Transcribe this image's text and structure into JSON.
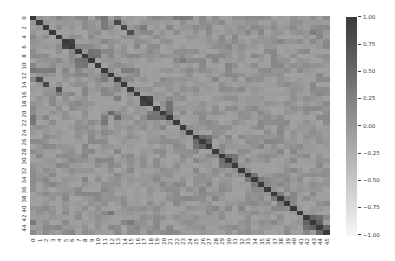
{
  "chart_data": {
    "type": "heatmap",
    "title": "",
    "xlabel": "",
    "ylabel": "",
    "n": 46,
    "x_tick_labels": [
      "0",
      "1",
      "2",
      "3",
      "4",
      "5",
      "6",
      "7",
      "8",
      "9",
      "10",
      "11",
      "12",
      "13",
      "14",
      "15",
      "16",
      "17",
      "18",
      "19",
      "20",
      "21",
      "22",
      "23",
      "24",
      "25",
      "26",
      "27",
      "28",
      "29",
      "30",
      "31",
      "32",
      "33",
      "34",
      "35",
      "36",
      "37",
      "38",
      "39",
      "40",
      "41",
      "42",
      "43",
      "44",
      "45"
    ],
    "y_tick_labels": [
      "0",
      "2",
      "4",
      "6",
      "8",
      "10",
      "12",
      "14",
      "16",
      "18",
      "20",
      "22",
      "24",
      "26",
      "28",
      "30",
      "32",
      "34",
      "36",
      "38",
      "40",
      "42",
      "44"
    ],
    "colorbar": {
      "vmin": -1.0,
      "vmax": 1.0,
      "ticks": [
        "1.00",
        "0.75",
        "0.50",
        "0.25",
        "0.00",
        "-0.25",
        "-0.50",
        "-0.75",
        "-1.00"
      ],
      "tick_values": [
        1.0,
        0.75,
        0.5,
        0.25,
        0.0,
        -0.25,
        -0.5,
        -0.75,
        -1.0
      ],
      "cmap": "grayscale (white at -1 → dark gray at +1)"
    },
    "diagonal_value": 1.0,
    "background_range": [
      -0.1,
      0.2
    ],
    "notable_cells": [
      {
        "r": 0,
        "c": 11,
        "v": 0.35
      },
      {
        "r": 1,
        "c": 11,
        "v": 0.3
      },
      {
        "r": 2,
        "c": 11,
        "v": 0.3
      },
      {
        "r": 1,
        "c": 13,
        "v": 0.85
      },
      {
        "r": 2,
        "c": 14,
        "v": 0.85
      },
      {
        "r": 3,
        "c": 15,
        "v": 0.8
      },
      {
        "r": 5,
        "c": 6,
        "v": 0.9
      },
      {
        "r": 6,
        "c": 5,
        "v": 0.9
      },
      {
        "r": 7,
        "c": 9,
        "v": 0.4
      },
      {
        "r": 7,
        "c": 10,
        "v": 0.35
      },
      {
        "r": 8,
        "c": 9,
        "v": 0.4
      },
      {
        "r": 8,
        "c": 10,
        "v": 0.4
      },
      {
        "r": 9,
        "c": 7,
        "v": 0.4
      },
      {
        "r": 9,
        "c": 8,
        "v": 0.4
      },
      {
        "r": 10,
        "c": 7,
        "v": 0.35
      },
      {
        "r": 10,
        "c": 8,
        "v": 0.4
      },
      {
        "r": 11,
        "c": 0,
        "v": 0.35
      },
      {
        "r": 11,
        "c": 1,
        "v": 0.3
      },
      {
        "r": 11,
        "c": 2,
        "v": 0.3
      },
      {
        "r": 11,
        "c": 3,
        "v": 0.3
      },
      {
        "r": 11,
        "c": 14,
        "v": 0.3
      },
      {
        "r": 11,
        "c": 15,
        "v": 0.3
      },
      {
        "r": 13,
        "c": 1,
        "v": 0.85
      },
      {
        "r": 14,
        "c": 2,
        "v": 0.85
      },
      {
        "r": 15,
        "c": 4,
        "v": 0.8
      },
      {
        "r": 12,
        "c": 11,
        "v": 0.3
      },
      {
        "r": 13,
        "c": 11,
        "v": 0.3
      },
      {
        "r": 17,
        "c": 18,
        "v": 0.9
      },
      {
        "r": 18,
        "c": 17,
        "v": 0.9
      },
      {
        "r": 18,
        "c": 21,
        "v": 0.4
      },
      {
        "r": 19,
        "c": 21,
        "v": 0.4
      },
      {
        "r": 20,
        "c": 21,
        "v": 0.5
      },
      {
        "r": 21,
        "c": 18,
        "v": 0.4
      },
      {
        "r": 21,
        "c": 19,
        "v": 0.4
      },
      {
        "r": 21,
        "c": 20,
        "v": 0.5
      },
      {
        "r": 20,
        "c": 18,
        "v": 0.3
      },
      {
        "r": 20,
        "c": 19,
        "v": 0.35
      },
      {
        "r": 21,
        "c": 0,
        "v": 0.35
      },
      {
        "r": 22,
        "c": 0,
        "v": 0.35
      },
      {
        "r": 21,
        "c": 11,
        "v": 0.3
      },
      {
        "r": 22,
        "c": 11,
        "v": 0.35
      },
      {
        "r": 20,
        "c": 12,
        "v": 0.5
      },
      {
        "r": 21,
        "c": 13,
        "v": 0.5
      },
      {
        "r": 16,
        "c": 4,
        "v": 0.3
      },
      {
        "r": 17,
        "c": 13,
        "v": 0.3
      },
      {
        "r": 25,
        "c": 26,
        "v": 0.5
      },
      {
        "r": 26,
        "c": 25,
        "v": 0.5
      },
      {
        "r": 25,
        "c": 27,
        "v": 0.4
      },
      {
        "r": 27,
        "c": 25,
        "v": 0.4
      },
      {
        "r": 26,
        "c": 27,
        "v": 0.6
      },
      {
        "r": 27,
        "c": 26,
        "v": 0.6
      },
      {
        "r": 29,
        "c": 30,
        "v": 0.45
      },
      {
        "r": 30,
        "c": 29,
        "v": 0.45
      },
      {
        "r": 29,
        "c": 31,
        "v": 0.35
      },
      {
        "r": 31,
        "c": 29,
        "v": 0.35
      },
      {
        "r": 30,
        "c": 31,
        "v": 0.4
      },
      {
        "r": 31,
        "c": 30,
        "v": 0.4
      },
      {
        "r": 33,
        "c": 34,
        "v": 0.35
      },
      {
        "r": 34,
        "c": 33,
        "v": 0.35
      },
      {
        "r": 34,
        "c": 35,
        "v": 0.3
      },
      {
        "r": 35,
        "c": 34,
        "v": 0.3
      },
      {
        "r": 37,
        "c": 38,
        "v": 0.3
      },
      {
        "r": 38,
        "c": 37,
        "v": 0.3
      },
      {
        "r": 38,
        "c": 39,
        "v": 0.3
      },
      {
        "r": 39,
        "c": 38,
        "v": 0.3
      },
      {
        "r": 42,
        "c": 43,
        "v": 0.55
      },
      {
        "r": 43,
        "c": 42,
        "v": 0.55
      },
      {
        "r": 43,
        "c": 44,
        "v": 0.6
      },
      {
        "r": 44,
        "c": 43,
        "v": 0.6
      },
      {
        "r": 42,
        "c": 44,
        "v": 0.45
      },
      {
        "r": 44,
        "c": 42,
        "v": 0.45
      },
      {
        "r": 44,
        "c": 45,
        "v": 0.5
      },
      {
        "r": 45,
        "c": 44,
        "v": 0.5
      },
      {
        "r": 43,
        "c": 0,
        "v": 0.3
      },
      {
        "r": 43,
        "c": 15,
        "v": 0.3
      },
      {
        "r": 41,
        "c": 12,
        "v": 0.35
      },
      {
        "r": 0,
        "c": 22,
        "v": 0.3
      },
      {
        "r": 0,
        "c": 23,
        "v": 0.3
      },
      {
        "r": 0,
        "c": 24,
        "v": 0.3
      },
      {
        "r": 2,
        "c": 17,
        "v": 0.3
      },
      {
        "r": 9,
        "c": 23,
        "v": 0.3
      },
      {
        "r": 3,
        "c": 43,
        "v": 0.3
      }
    ],
    "noise_seed": 7,
    "legend": "colorbar right"
  }
}
